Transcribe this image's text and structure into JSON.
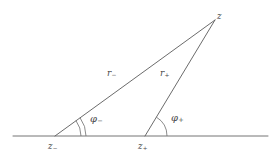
{
  "figure": {
    "type": "geometry-diagram",
    "background_color": "#ffffff",
    "stroke_color": "#555555",
    "label_color": "#4a4a4a",
    "width": 280,
    "height": 159
  },
  "labels": {
    "apex": {
      "base": "z",
      "sub": ""
    },
    "vertex_left": {
      "base": "z",
      "sub": "−"
    },
    "vertex_right": {
      "base": "z",
      "sub": "+"
    },
    "side_left": {
      "base": "r",
      "sub": "−"
    },
    "side_right": {
      "base": "r",
      "sub": "+"
    },
    "angle_left": {
      "base": "φ",
      "sub": "−"
    },
    "angle_right": {
      "base": "φ",
      "sub": "+"
    }
  },
  "geometry": {
    "baseline": {
      "x1": 13,
      "y1": 136,
      "x2": 268,
      "y2": 136
    },
    "apex_point": {
      "x": 215,
      "y": 20
    },
    "vertex_left_point": {
      "x": 55,
      "y": 136
    },
    "vertex_right_point": {
      "x": 145,
      "y": 136
    },
    "ray_left": {
      "x1": 55,
      "y1": 136,
      "x2": 215,
      "y2": 20
    },
    "ray_right": {
      "x1": 145,
      "y1": 136,
      "x2": 215,
      "y2": 20
    },
    "arcs_left": [
      {
        "radius": 26,
        "start_angle": 0,
        "end_angle": 36
      },
      {
        "radius": 31,
        "start_angle": 0,
        "end_angle": 36
      }
    ],
    "arcs_right": [
      {
        "radius": 22,
        "start_angle": 0,
        "end_angle": 59
      }
    ]
  }
}
